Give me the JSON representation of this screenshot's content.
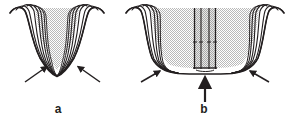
{
  "figure": {
    "kind": "two-panel-line-drawing",
    "width": 293,
    "height": 128,
    "background_color": "#ffffff",
    "ink_color": "#231f20",
    "fill_color": "#d9d9d9",
    "caption_labels": [
      "a",
      "b"
    ]
  },
  "panels": [
    {
      "id": "a",
      "label": "a",
      "label_position": {
        "x": 58,
        "y": 109
      },
      "description": "Funnel-shaped structure with converging fiber bundles, closed tapered apex",
      "apex_state": "closed-tapered",
      "fiber_bundle_count_left": 6,
      "fiber_bundle_count_right": 6,
      "shading": "halftone-gray",
      "annotation_arrows": [
        {
          "name": "left-indicator-arrow",
          "from": {
            "x": 26,
            "y": 82
          },
          "to": {
            "x": 48,
            "y": 66
          },
          "direction": "up-right"
        },
        {
          "name": "right-indicator-arrow",
          "from": {
            "x": 100,
            "y": 82
          },
          "to": {
            "x": 78,
            "y": 66
          },
          "direction": "up-left"
        }
      ],
      "center_tube": null
    },
    {
      "id": "b",
      "label": "b",
      "label_position": {
        "x": 203,
        "y": 109
      },
      "description": "Same funnel structure with apex opened and a tubular device inserted through the center",
      "apex_state": "open-flattened",
      "fiber_bundle_count_left": 6,
      "fiber_bundle_count_right": 6,
      "shading": "halftone-gray",
      "annotation_arrows": [
        {
          "name": "left-indicator-arrow",
          "from": {
            "x": 142,
            "y": 82
          },
          "to": {
            "x": 160,
            "y": 70
          },
          "direction": "up-right"
        },
        {
          "name": "right-indicator-arrow",
          "from": {
            "x": 268,
            "y": 82
          },
          "to": {
            "x": 250,
            "y": 70
          },
          "direction": "up-left"
        },
        {
          "name": "insertion-arrow",
          "from": {
            "x": 205,
            "y": 105
          },
          "to": {
            "x": 205,
            "y": 78
          },
          "direction": "up"
        }
      ],
      "center_tube": {
        "name": "inserted-tube",
        "wall_line_count": 4,
        "top_y": 8,
        "bottom_y": 68,
        "left_x": 194,
        "right_x": 216,
        "tick_marks_y": 42,
        "tick_mark_count": 3
      }
    }
  ]
}
